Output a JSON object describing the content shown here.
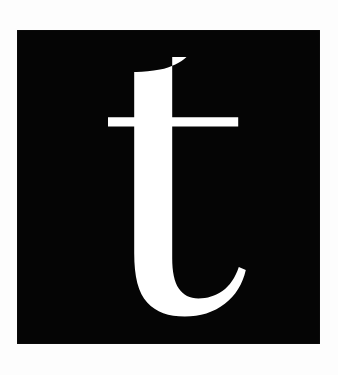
{
  "canvas": {
    "width": 338,
    "height": 375,
    "background_color": "#fdfdfd",
    "description": "Typographic specimen tile: a white lowercase serif letter on a black square"
  },
  "tile": {
    "name": "letter-tile",
    "shape": "square",
    "fill_color": "#050505",
    "x": 17,
    "y": 30,
    "width": 303,
    "height": 314
  },
  "glyph": {
    "character": "t",
    "case": "lowercase",
    "style": "serif",
    "fill_color": "#ffffff",
    "stem": {
      "left": 134,
      "right": 191,
      "top": 57,
      "bottom": 313,
      "width": 57
    },
    "crossbar": {
      "left": 108,
      "right": 238,
      "top": 117,
      "bottom": 126,
      "thickness": 9
    },
    "tail": {
      "direction": "right",
      "terminal_x": 240,
      "terminal_y": 272
    },
    "ascender_top_right_y": 57,
    "ascender_top_left_y": 72,
    "baseline_y": 313,
    "path": "M 186.5 57 C 181.0 62.5 171.0 67.4 160.0 69.6 C 150.5 71.5 141.5 72.2 134.2 72.0 L 134.2 117.2 L 108.0 117.2 L 108.0 126.4 L 134.2 126.4 L 134.2 253.0 C 134.2 276.5 138.2 292.8 147.2 302.6 C 156.2 312.4 168.6 316.6 184.8 316.6 C 200.2 316.6 213.6 312.4 224.8 303.8 C 235.6 295.5 242.6 284.2 245.8 270.0 L 238.8 267.0 C 235.2 277.8 229.8 285.8 222.4 291.0 C 215.2 296.0 207.2 298.4 198.4 298.4 C 189.8 298.4 183.2 295.2 178.8 288.6 C 174.4 282.0 172.2 271.8 172.2 258.0 L 172.2 126.4 L 238.2 126.4 L 238.2 117.2 L 172.2 117.2 L 172.2 57 Z"
  }
}
